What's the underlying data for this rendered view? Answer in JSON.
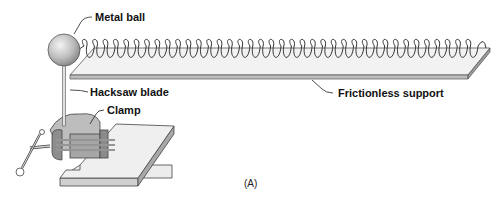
{
  "figure": {
    "caption": "(A)",
    "labels": {
      "metal_ball": "Metal ball",
      "hacksaw_blade": "Hacksaw blade",
      "clamp": "Clamp",
      "frictionless_support": "Frictionless support"
    },
    "components": [
      {
        "id": "metal-ball",
        "shape": "sphere",
        "color": "#b8b8b8"
      },
      {
        "id": "spring",
        "shape": "helix",
        "color": "#333333",
        "coils": 38
      },
      {
        "id": "frictionless-support",
        "shape": "flat-plate",
        "color": "#e8e8e8"
      },
      {
        "id": "hacksaw-blade",
        "shape": "thin-rod",
        "color": "#d0d0d0"
      },
      {
        "id": "clamp",
        "shape": "vise",
        "color": "#9a9a9a"
      },
      {
        "id": "table",
        "shape": "slab",
        "color": "#e0e0e0"
      }
    ]
  }
}
